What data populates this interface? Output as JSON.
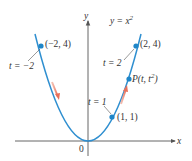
{
  "figure": {
    "curve_label": "y = x²",
    "axes": {
      "x_label": "x",
      "y_label": "y",
      "origin_label": "0"
    },
    "points": [
      {
        "label": "(−2, 4)",
        "param_label": "t = −2",
        "x": -2,
        "y": 4
      },
      {
        "label": "(2, 4)",
        "param_label": "t = 2",
        "x": 2,
        "y": 4
      },
      {
        "label": "(1, 1)",
        "param_label": "t = 1",
        "x": 1,
        "y": 1
      },
      {
        "label": "P(t, t²)",
        "param_label": "",
        "x": 1.7,
        "y": 2.89
      }
    ],
    "colors": {
      "curve": "#2f8fd0",
      "point": "#1f86c8",
      "arrow": "#e8705a",
      "axis": "#555555"
    }
  }
}
